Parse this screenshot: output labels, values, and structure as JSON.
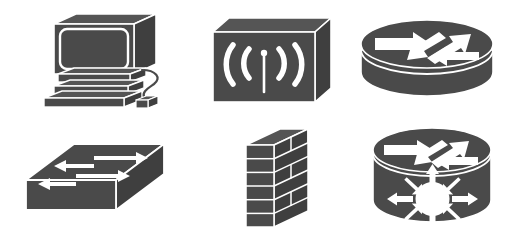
{
  "canvas": {
    "width": 513,
    "height": 249,
    "background_color": "#ffffff"
  },
  "palette": {
    "device_fill": "#4a4a4a",
    "device_face_dark": "#3f3f3f",
    "device_face_light": "#555555",
    "outline": "#ffffff",
    "detail_white": "#ffffff",
    "background": "#ffffff"
  },
  "icon_set": {
    "title": "Network Device Icons",
    "style": "cisco-style isometric line art",
    "columns": 3,
    "rows": 2,
    "icons": [
      {
        "id": "workstation",
        "name": "workstation-icon",
        "label": "Workstation",
        "row": 1,
        "column": 1,
        "description": "CRT monitor on stacked desktop chassis with keyboard and cabled mouse",
        "parts": [
          "monitor",
          "screen",
          "chassis-upper",
          "chassis-lower",
          "keyboard",
          "mouse",
          "mouse-cable"
        ]
      },
      {
        "id": "access-point",
        "name": "wireless-access-point-icon",
        "label": "Wireless Access Point",
        "row": 1,
        "column": 2,
        "description": "3D box with vertical antenna and two radiating wave arcs on each side",
        "parts": [
          "box-front",
          "box-top",
          "box-side",
          "antenna",
          "wave-left-inner",
          "wave-left-outer",
          "wave-right-inner",
          "wave-right-outer"
        ],
        "wave_count": 4
      },
      {
        "id": "router",
        "name": "router-icon",
        "label": "Router",
        "row": 1,
        "column": 3,
        "description": "Short cylinder with four white directional arrows on the top face",
        "parts": [
          "cylinder-body",
          "cylinder-top",
          "arrow-ne",
          "arrow-se",
          "arrow-w",
          "arrow-sw"
        ],
        "arrow_count": 4
      },
      {
        "id": "switch",
        "name": "network-switch-icon",
        "label": "Switch",
        "row": 2,
        "column": 1,
        "description": "Flat isometric slab with four parallel arrows alternating direction on the top face",
        "parts": [
          "slab-top",
          "slab-front",
          "slab-side",
          "arrow-right-1",
          "arrow-left-1",
          "arrow-right-2",
          "arrow-left-2"
        ],
        "arrow_count": 4
      },
      {
        "id": "firewall",
        "name": "firewall-icon",
        "label": "Firewall",
        "row": 2,
        "column": 2,
        "description": "Isometric brick wall with six staggered courses",
        "parts": [
          "wall-front",
          "wall-side",
          "wall-top"
        ],
        "brick_rows": 6
      },
      {
        "id": "multilayer-switch",
        "name": "multilayer-switch-icon",
        "label": "Multilayer Switch",
        "row": 2,
        "column": 3,
        "description": "Tall cylinder with four router arrows on top and an eight-spoke radiating hub on the front face",
        "parts": [
          "cylinder-body",
          "cylinder-top",
          "arrow-ne",
          "arrow-se",
          "arrow-w",
          "arrow-sw",
          "hub-circle",
          "hub-spokes"
        ],
        "arrow_count": 4,
        "spoke_count": 8
      }
    ]
  }
}
